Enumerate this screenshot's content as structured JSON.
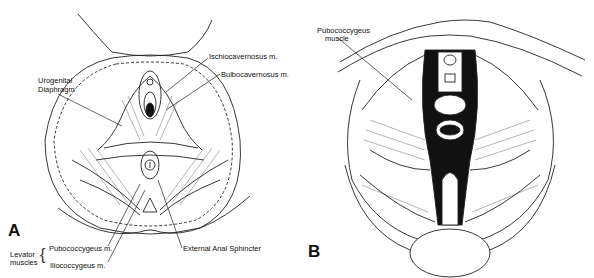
{
  "figure": {
    "panels": [
      {
        "id": "A",
        "letter": "A",
        "labels": {
          "ischiocavernosus": "Ischiocavernosus  m.",
          "bulbocavernosus": "Bulbocavernosus  m.",
          "urogenital_1": "Urogenital",
          "urogenital_2": "Diaphragm",
          "levator_1": "Levator",
          "levator_2": "muscles",
          "pubococcygeus": "Pubococcygeus  m.",
          "iliococcygeus": "Iliococcygeus  m.",
          "external_anal_sphincter": "External  Anal  Sphincter"
        }
      },
      {
        "id": "B",
        "letter": "B",
        "labels": {
          "pubococcygeus_1": "Pubococcygeus",
          "pubococcygeus_2": "muscle"
        }
      }
    ]
  }
}
